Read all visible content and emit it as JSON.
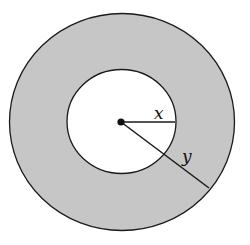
{
  "diagram": {
    "labels": {
      "inner_radius": "x",
      "outer_radius": "y"
    },
    "colors": {
      "ring_fill": "#c6c6c6",
      "inner_fill": "#ffffff",
      "stroke": "#1a1a1a"
    }
  }
}
